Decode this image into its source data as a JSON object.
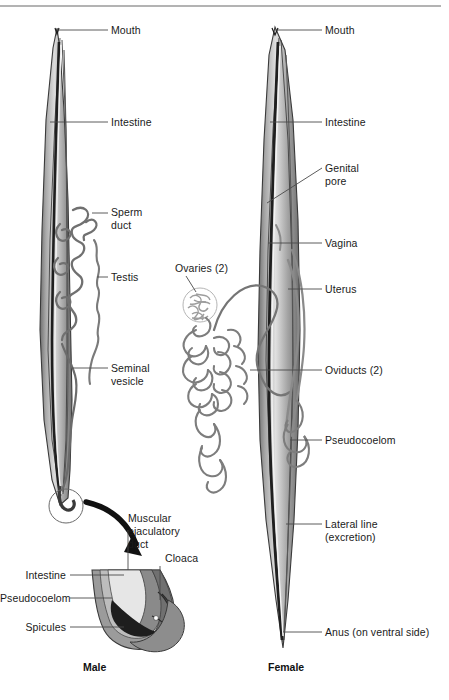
{
  "figure": {
    "top_rule_color": "#b3b3b3",
    "background": "#ffffff",
    "ink_color": "#1a1a1a"
  },
  "male": {
    "caption": "Male",
    "labels": {
      "mouth": "Mouth",
      "intestine": "Intestine",
      "sperm_duct_line1": "Sperm",
      "sperm_duct_line2": "duct",
      "testis": "Testis",
      "seminal_vesicle_line1": "Seminal",
      "seminal_vesicle_line2": "vesicle"
    }
  },
  "female": {
    "caption": "Female",
    "labels": {
      "mouth": "Mouth",
      "intestine": "Intestine",
      "genital_pore_line1": "Genital",
      "genital_pore_line2": "pore",
      "vagina": "Vagina",
      "uterus": "Uterus",
      "ovaries": "Ovaries (2)",
      "oviducts": "Oviducts (2)",
      "pseudocoelom": "Pseudocoelom",
      "lateral_line_line1": "Lateral line",
      "lateral_line_line2": "(excretion)",
      "anus": "Anus (on ventral side)"
    }
  },
  "inset": {
    "labels": {
      "muscular_duct_line1": "Muscular",
      "muscular_duct_line2": "ejaculatory",
      "muscular_duct_line3": "duct",
      "cloaca": "Cloaca",
      "intestine": "Intestine",
      "pseudocoelom": "Pseudocoelom",
      "spicules": "Spicules"
    }
  },
  "palette": {
    "outline": "#3a3a3a",
    "body_gray": "#9a9a9a",
    "body_gray_dark": "#6d6d6d",
    "body_gray_light": "#c9c9c9",
    "body_fill_pale": "#e2e2e2",
    "dark_band": "#2b2b2b",
    "leader": "#4a4a4a"
  }
}
